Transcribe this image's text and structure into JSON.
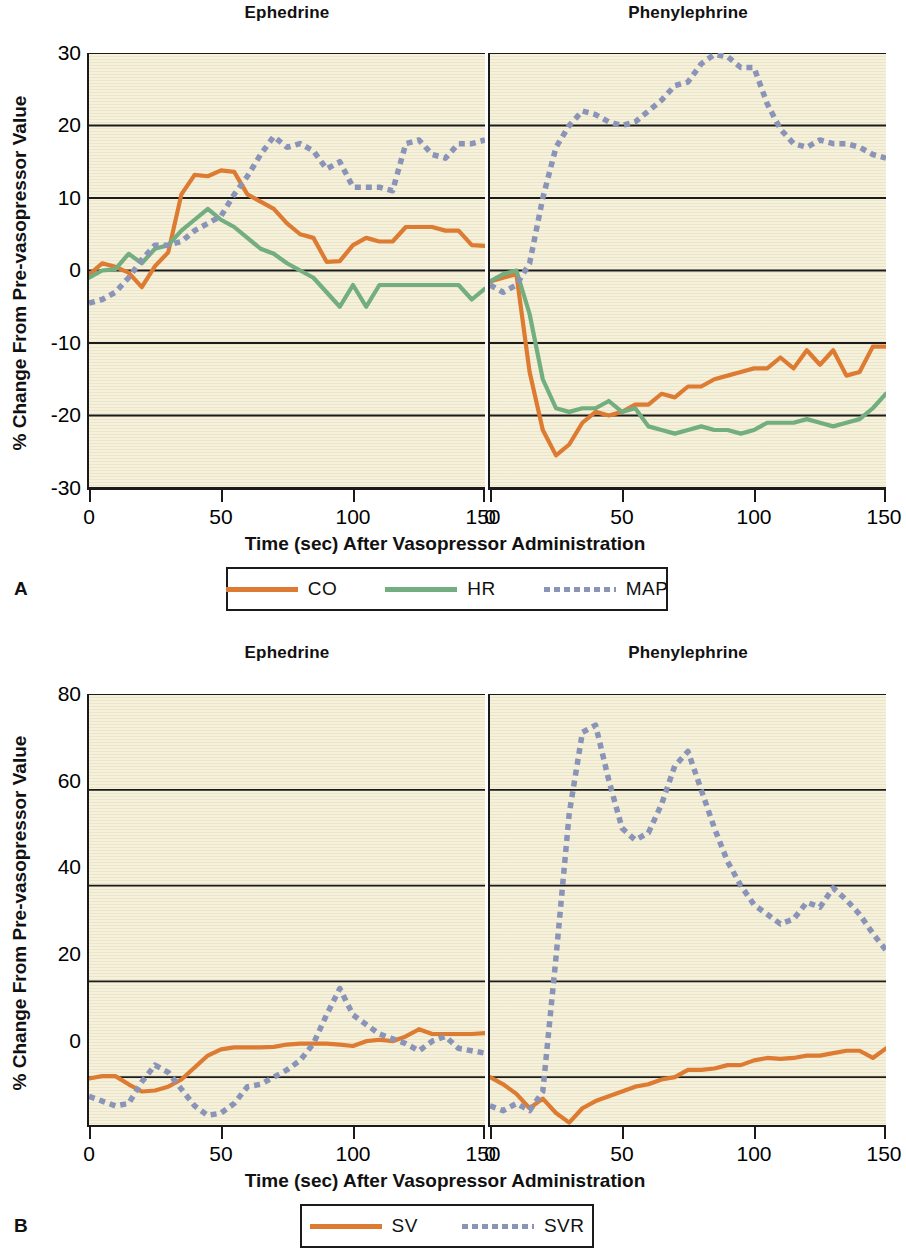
{
  "figure": {
    "panels": [
      {
        "letter": "A",
        "ylabel": "% Change From Pre-vasopressor Value",
        "xlabel": "Time (sec) After Vasopressor Administration",
        "yticks": [
          "30",
          "20",
          "10",
          "0",
          "-10",
          "-20",
          "-30"
        ],
        "xticks": [
          "0",
          "50",
          "100",
          "150"
        ],
        "subpanels": [
          {
            "title": "Ephedrine"
          },
          {
            "title": "Phenylephrine"
          }
        ],
        "legend": [
          {
            "label": "CO",
            "style": "solid",
            "color": "#DD7B33"
          },
          {
            "label": "HR",
            "style": "solid",
            "color": "#72AE80"
          },
          {
            "label": "MAP",
            "style": "dotted",
            "color": "#8A93B8"
          }
        ]
      },
      {
        "letter": "B",
        "ylabel": "% Change From Pre-vasopressor Value",
        "xlabel": "Time (sec) After Vasopressor Administration",
        "yticks": [
          "80",
          "60",
          "40",
          "20",
          "0"
        ],
        "xticks": [
          "0",
          "50",
          "100",
          "150"
        ],
        "subpanels": [
          {
            "title": "Ephedrine"
          },
          {
            "title": "Phenylephrine"
          }
        ],
        "legend": [
          {
            "label": "SV",
            "style": "solid",
            "color": "#DD7B33"
          },
          {
            "label": "SVR",
            "style": "dotted",
            "color": "#8A93B8"
          }
        ]
      }
    ]
  },
  "chart_data": [
    {
      "type": "line",
      "title": "A — Ephedrine",
      "panel": "A",
      "subpanel": "Ephedrine",
      "xlabel": "Time (sec) After Vasopressor Administration",
      "ylabel": "% Change From Pre-vasopressor Value",
      "xlim": [
        0,
        150
      ],
      "ylim": [
        -30,
        30
      ],
      "xticks": [
        0,
        50,
        100,
        150
      ],
      "yticks": [
        -30,
        -20,
        -10,
        0,
        10,
        20,
        30
      ],
      "grid": "horizontal",
      "legend_position": "below-figure",
      "x": [
        0,
        5,
        10,
        15,
        20,
        25,
        30,
        35,
        40,
        45,
        50,
        55,
        60,
        65,
        70,
        75,
        80,
        85,
        90,
        95,
        100,
        105,
        110,
        115,
        120,
        125,
        130,
        135,
        140,
        145,
        150
      ],
      "series": [
        {
          "name": "CO",
          "color": "#DD7B33",
          "style": "solid",
          "values": [
            -0.6,
            1.0,
            0.5,
            -0.3,
            -2.3,
            0.6,
            2.5,
            10.5,
            13.2,
            13.0,
            13.8,
            13.6,
            10.5,
            9.5,
            8.5,
            6.5,
            5.0,
            4.5,
            1.2,
            1.3,
            3.5,
            4.5,
            4.0,
            4.0,
            6.0,
            6.0,
            6.0,
            5.5,
            5.5,
            3.5,
            3.4
          ]
        },
        {
          "name": "HR",
          "color": "#72AE80",
          "style": "solid",
          "values": [
            -1.0,
            0.0,
            0.2,
            2.3,
            1.0,
            3.0,
            3.5,
            5.5,
            7.0,
            8.5,
            7.0,
            6.0,
            4.5,
            3.0,
            2.3,
            1.0,
            0.0,
            -1.0,
            -3.0,
            -5.0,
            -2.0,
            -5.0,
            -2.0,
            -2.0,
            -2.0,
            -2.0,
            -2.0,
            -2.0,
            -2.0,
            -4.0,
            -2.5
          ]
        },
        {
          "name": "MAP",
          "color": "#8A93B8",
          "style": "dotted",
          "values": [
            -4.5,
            -4.0,
            -3.0,
            -1.0,
            1.5,
            3.5,
            3.5,
            4.0,
            5.5,
            6.5,
            7.5,
            10.5,
            13.0,
            16.0,
            18.5,
            17.0,
            17.5,
            16.5,
            14.0,
            15.0,
            11.5,
            11.5,
            11.5,
            11.0,
            17.5,
            18.0,
            16.0,
            15.5,
            17.5,
            17.5,
            18.0
          ]
        }
      ]
    },
    {
      "type": "line",
      "title": "A — Phenylephrine",
      "panel": "A",
      "subpanel": "Phenylephrine",
      "xlabel": "Time (sec) After Vasopressor Administration",
      "ylabel": "% Change From Pre-vasopressor Value",
      "xlim": [
        0,
        150
      ],
      "ylim": [
        -30,
        30
      ],
      "xticks": [
        0,
        50,
        100,
        150
      ],
      "yticks": [
        -30,
        -20,
        -10,
        0,
        10,
        20,
        30
      ],
      "grid": "horizontal",
      "x": [
        0,
        5,
        10,
        15,
        20,
        25,
        30,
        35,
        40,
        45,
        50,
        55,
        60,
        65,
        70,
        75,
        80,
        85,
        90,
        95,
        100,
        105,
        110,
        115,
        120,
        125,
        130,
        135,
        140,
        145,
        150
      ],
      "series": [
        {
          "name": "CO",
          "color": "#DD7B33",
          "style": "solid",
          "values": [
            -1.5,
            -1.0,
            -0.5,
            -14.0,
            -22.0,
            -25.5,
            -24.0,
            -21.0,
            -19.5,
            -20.0,
            -19.5,
            -18.5,
            -18.5,
            -17.0,
            -17.5,
            -16.0,
            -16.0,
            -15.0,
            -14.5,
            -14.0,
            -13.5,
            -13.5,
            -12.0,
            -13.5,
            -11.0,
            -13.0,
            -11.0,
            -14.5,
            -14.0,
            -10.5,
            -10.5
          ]
        },
        {
          "name": "HR",
          "color": "#72AE80",
          "style": "solid",
          "values": [
            -1.5,
            -0.5,
            0.0,
            -6.0,
            -15.0,
            -19.0,
            -19.5,
            -19.0,
            -19.0,
            -18.0,
            -19.5,
            -19.0,
            -21.5,
            -22.0,
            -22.5,
            -22.0,
            -21.5,
            -22.0,
            -22.0,
            -22.5,
            -22.0,
            -21.0,
            -21.0,
            -21.0,
            -20.5,
            -21.0,
            -21.5,
            -21.0,
            -20.5,
            -19.0,
            -17.0
          ]
        },
        {
          "name": "MAP",
          "color": "#8A93B8",
          "style": "dotted",
          "values": [
            -2.0,
            -3.0,
            -2.0,
            1.0,
            10.0,
            17.0,
            20.0,
            22.0,
            21.5,
            20.5,
            20.0,
            20.5,
            22.0,
            23.5,
            25.5,
            26.0,
            28.5,
            29.8,
            29.5,
            28.0,
            28.0,
            23.0,
            19.5,
            17.5,
            17.0,
            18.0,
            17.5,
            17.5,
            17.0,
            16.0,
            15.5
          ]
        }
      ]
    },
    {
      "type": "line",
      "title": "B — Ephedrine",
      "panel": "B",
      "subpanel": "Ephedrine",
      "xlabel": "Time (sec) After Vasopressor Administration",
      "ylabel": "% Change From Pre-vasopressor Value",
      "xlim": [
        0,
        150
      ],
      "ylim": [
        -10,
        80
      ],
      "xticks": [
        0,
        50,
        100,
        150
      ],
      "yticks": [
        0,
        20,
        40,
        60,
        80
      ],
      "grid": "horizontal",
      "x": [
        0,
        5,
        10,
        15,
        20,
        25,
        30,
        35,
        40,
        45,
        50,
        55,
        60,
        65,
        70,
        75,
        80,
        85,
        90,
        95,
        100,
        105,
        110,
        115,
        120,
        125,
        130,
        135,
        140,
        145,
        150
      ],
      "series": [
        {
          "name": "SV",
          "color": "#DD7B33",
          "style": "solid",
          "values": [
            -0.3,
            0.2,
            0.2,
            -1.5,
            -3.0,
            -2.8,
            -2.0,
            -0.5,
            2.0,
            4.5,
            5.8,
            6.2,
            6.2,
            6.2,
            6.3,
            6.8,
            7.0,
            7.0,
            7.0,
            6.8,
            6.5,
            7.5,
            7.8,
            7.5,
            8.5,
            10.0,
            9.0,
            9.0,
            9.0,
            9.0,
            9.2
          ]
        },
        {
          "name": "SVR",
          "color": "#8A93B8",
          "style": "dotted",
          "values": [
            -4.0,
            -5.0,
            -6.0,
            -5.5,
            -1.0,
            2.5,
            1.0,
            -2.5,
            -6.0,
            -8.0,
            -7.5,
            -5.5,
            -2.0,
            -1.5,
            0.0,
            1.5,
            3.5,
            7.0,
            13.0,
            18.5,
            13.0,
            11.0,
            9.0,
            8.0,
            7.0,
            5.5,
            7.5,
            8.5,
            6.0,
            5.5,
            5.0
          ]
        }
      ]
    },
    {
      "type": "line",
      "title": "B — Phenylephrine",
      "panel": "B",
      "subpanel": "Phenylephrine",
      "xlabel": "Time (sec) After Vasopressor Administration",
      "ylabel": "% Change From Pre-vasopressor Value",
      "xlim": [
        0,
        150
      ],
      "ylim": [
        -10,
        80
      ],
      "xticks": [
        0,
        50,
        100,
        150
      ],
      "yticks": [
        0,
        20,
        40,
        60,
        80
      ],
      "grid": "horizontal",
      "x": [
        0,
        5,
        10,
        15,
        20,
        25,
        30,
        35,
        40,
        45,
        50,
        55,
        60,
        65,
        70,
        75,
        80,
        85,
        90,
        95,
        100,
        105,
        110,
        115,
        120,
        125,
        130,
        135,
        140,
        145,
        150
      ],
      "series": [
        {
          "name": "SV",
          "color": "#DD7B33",
          "style": "solid",
          "values": [
            0.0,
            -1.5,
            -3.5,
            -6.5,
            -4.5,
            -7.5,
            -9.5,
            -6.5,
            -5.0,
            -4.0,
            -3.0,
            -2.0,
            -1.5,
            -0.5,
            0.0,
            1.5,
            1.5,
            1.8,
            2.5,
            2.5,
            3.5,
            4.0,
            3.8,
            4.0,
            4.5,
            4.5,
            5.0,
            5.5,
            5.5,
            4.0,
            6.0
          ]
        },
        {
          "name": "SVR",
          "color": "#8A93B8",
          "style": "dotted",
          "values": [
            -6.0,
            -7.0,
            -5.5,
            -7.0,
            -3.0,
            25.0,
            55.0,
            72.0,
            73.5,
            62.0,
            52.0,
            49.5,
            51.0,
            57.0,
            65.0,
            68.0,
            60.0,
            52.0,
            45.0,
            40.0,
            36.0,
            34.0,
            32.0,
            33.0,
            36.5,
            35.5,
            39.5,
            37.0,
            34.0,
            30.0,
            26.5
          ]
        }
      ]
    }
  ]
}
